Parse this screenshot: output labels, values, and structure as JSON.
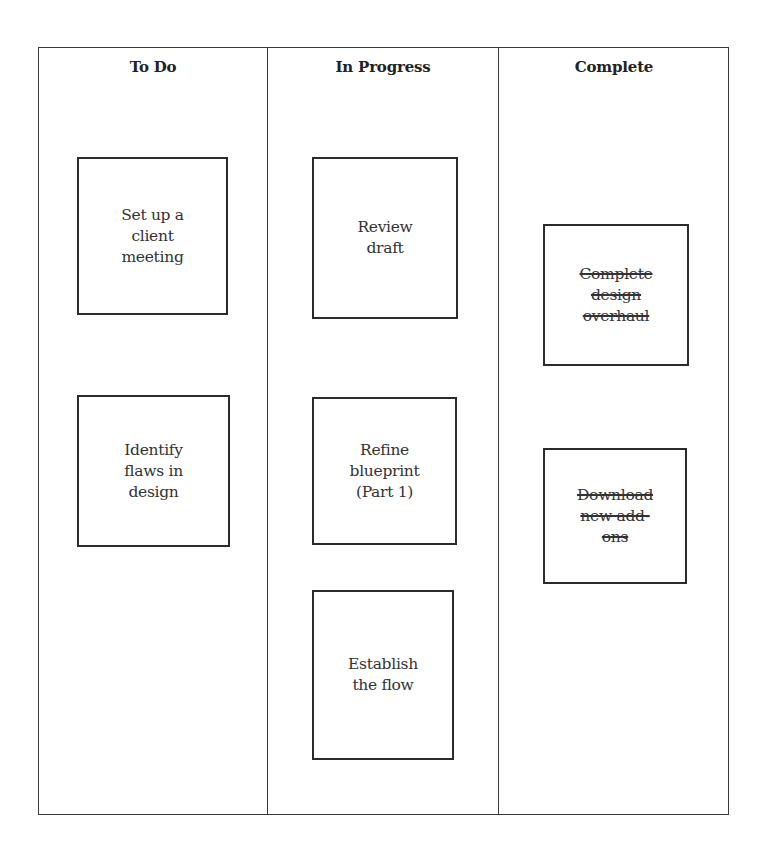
{
  "board": {
    "columns": [
      {
        "title": "To Do",
        "cards": [
          {
            "text": "Set up a\nclient\nmeeting",
            "done": false
          },
          {
            "text": "Identify\nflaws in\ndesign",
            "done": false
          }
        ]
      },
      {
        "title": "In Progress",
        "cards": [
          {
            "text": "Review\ndraft",
            "done": false
          },
          {
            "text": "Refine\nblueprint\n(Part 1)",
            "done": false
          },
          {
            "text": "Establish\nthe flow",
            "done": false
          }
        ]
      },
      {
        "title": "Complete",
        "cards": [
          {
            "text": "Complete\ndesign\noverhaul",
            "done": true
          },
          {
            "text": "Download\nnew add-\nons",
            "done": true
          }
        ]
      }
    ]
  }
}
